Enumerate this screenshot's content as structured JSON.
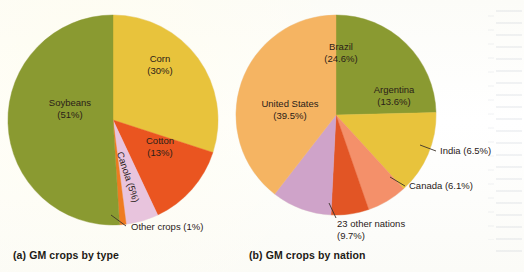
{
  "figure": {
    "background_color": "#fdfdfb",
    "text_color": "#2a2118"
  },
  "panels": [
    {
      "id": "panel-a",
      "caption": "(a) GM crops by type",
      "center": {
        "x": 113,
        "y": 120
      },
      "radius": 105,
      "start_angle_deg": 0
    },
    {
      "id": "panel-b",
      "caption": "(b) GM crops by nation",
      "center": {
        "x": 336,
        "y": 115
      },
      "radius": 100,
      "start_angle_deg": 0
    }
  ],
  "chart_data": [
    {
      "type": "pie",
      "title": "(a) GM crops by type",
      "panel": "a",
      "start_angle_deg": 0,
      "direction": "clockwise",
      "labels_inside": true,
      "categories": [
        "Corn",
        "Cotton",
        "Canola",
        "Other crops",
        "Soybeans"
      ],
      "values": [
        30,
        13,
        5,
        1,
        51
      ],
      "unit": "%",
      "colors": [
        "#e8c33c",
        "#ea5520",
        "#e8c4dd",
        "#ef7b21",
        "#8a9a31"
      ],
      "slices": [
        {
          "name": "Corn",
          "value": 30,
          "label": "Corn",
          "value_label": "(30%)",
          "color": "#e8c33c",
          "label_placement": "inside",
          "label_x": 160,
          "label_y": 62,
          "rotation": 0
        },
        {
          "name": "Cotton",
          "value": 13,
          "label": "Cotton",
          "value_label": "(13%)",
          "color": "#ea5520",
          "label_placement": "inside",
          "label_x": 160,
          "label_y": 144,
          "rotation": 0
        },
        {
          "name": "Canola",
          "value": 5,
          "label": "Canola (5%)",
          "value_label": "",
          "color": "#e8c4dd",
          "label_placement": "inside-rotated",
          "label_x": 125,
          "label_y": 178,
          "rotation": 72
        },
        {
          "name": "Other crops",
          "value": 1,
          "label": "Other crops (1%)",
          "value_label": "",
          "color": "#ef7b21",
          "label_placement": "callout",
          "label_x": 131,
          "label_y": 230,
          "leader": {
            "x1": 111,
            "y1": 215,
            "x2": 126,
            "y2": 226
          },
          "rotation": 0
        },
        {
          "name": "Soybeans",
          "value": 51,
          "label": "Soybeans",
          "value_label": "(51%)",
          "color": "#8a9a31",
          "label_placement": "inside",
          "label_x": 70,
          "label_y": 106,
          "rotation": 0
        }
      ]
    },
    {
      "type": "pie",
      "title": "(b) GM crops by nation",
      "panel": "b",
      "start_angle_deg": 0,
      "direction": "clockwise",
      "labels_inside": true,
      "categories": [
        "Brazil",
        "Argentina",
        "India",
        "Canada",
        "23 other nations",
        "United States"
      ],
      "values": [
        24.6,
        13.6,
        6.5,
        6.1,
        9.7,
        39.5
      ],
      "unit": "%",
      "colors": [
        "#8a9a31",
        "#e8c33c",
        "#f4906a",
        "#e25525",
        "#cfa3c9",
        "#f5b462"
      ],
      "slices": [
        {
          "name": "Brazil",
          "value": 24.6,
          "label": "Brazil",
          "value_label": "(24.6%)",
          "color": "#8a9a31",
          "label_placement": "inside",
          "label_x": 341,
          "label_y": 50,
          "rotation": 0
        },
        {
          "name": "Argentina",
          "value": 13.6,
          "label": "Argentina",
          "value_label": "(13.6%)",
          "color": "#e8c33c",
          "label_placement": "inside",
          "label_x": 394,
          "label_y": 93,
          "rotation": 0
        },
        {
          "name": "India",
          "value": 6.5,
          "label": "India (6.5%)",
          "value_label": "",
          "color": "#f4906a",
          "label_placement": "callout",
          "label_x": 440,
          "label_y": 154,
          "leader": {
            "x1": 420,
            "y1": 145,
            "x2": 436,
            "y2": 151
          },
          "rotation": 0
        },
        {
          "name": "Canada",
          "value": 6.1,
          "label": "Canada (6.1%)",
          "value_label": "",
          "color": "#e25525",
          "label_placement": "callout",
          "label_x": 409,
          "label_y": 189,
          "leader": {
            "x1": 390,
            "y1": 177,
            "x2": 405,
            "y2": 186
          },
          "rotation": 0
        },
        {
          "name": "23 other nations",
          "value": 9.7,
          "label": "23 other nations",
          "value_label": "(9.7%)",
          "color": "#cfa3c9",
          "label_placement": "callout",
          "label_x": 337,
          "label_y": 227,
          "leader": {
            "x1": 329,
            "y1": 203,
            "x2": 336,
            "y2": 218
          },
          "rotation": 0
        },
        {
          "name": "United States",
          "value": 39.5,
          "label": "United States",
          "value_label": "(39.5%)",
          "color": "#f5b462",
          "label_placement": "inside",
          "label_x": 290,
          "label_y": 107,
          "rotation": 0
        }
      ]
    }
  ]
}
